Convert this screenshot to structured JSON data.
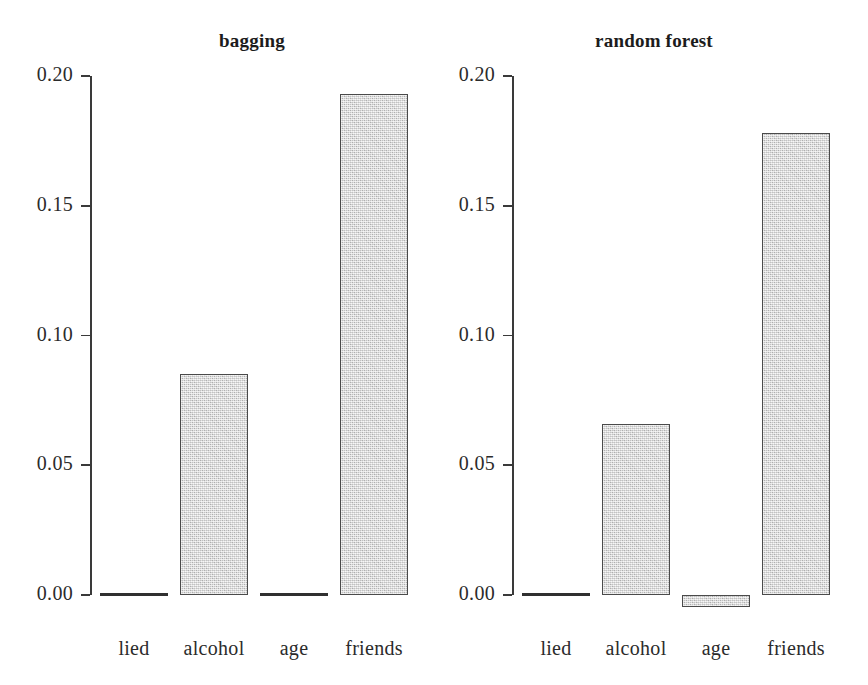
{
  "figure": {
    "background_color": "#ffffff",
    "bar_fill_color": "#d2d2d2",
    "bar_border_color": "#4a4a4a",
    "axis_color": "#3a3a3a"
  },
  "chart_data": [
    {
      "type": "bar",
      "title": "bagging",
      "xlabel": "",
      "ylabel": "",
      "categories": [
        "lied",
        "alcohol",
        "age",
        "friends"
      ],
      "values": [
        0.0,
        0.085,
        0.0,
        0.193
      ],
      "ylim": [
        0.0,
        0.2
      ],
      "yticks": [
        0.0,
        0.05,
        0.1,
        0.15,
        0.2
      ],
      "ytick_labels": [
        "0.00",
        "0.05",
        "0.10",
        "0.15",
        "0.20"
      ],
      "grid": false,
      "legend": "none"
    },
    {
      "type": "bar",
      "title": "random forest",
      "xlabel": "",
      "ylabel": "",
      "categories": [
        "lied",
        "alcohol",
        "age",
        "friends"
      ],
      "values": [
        0.0,
        0.066,
        -0.004,
        0.178
      ],
      "ylim": [
        0.0,
        0.2
      ],
      "yticks": [
        0.0,
        0.05,
        0.1,
        0.15,
        0.2
      ],
      "ytick_labels": [
        "0.00",
        "0.05",
        "0.10",
        "0.15",
        "0.20"
      ],
      "grid": false,
      "legend": "none"
    }
  ]
}
